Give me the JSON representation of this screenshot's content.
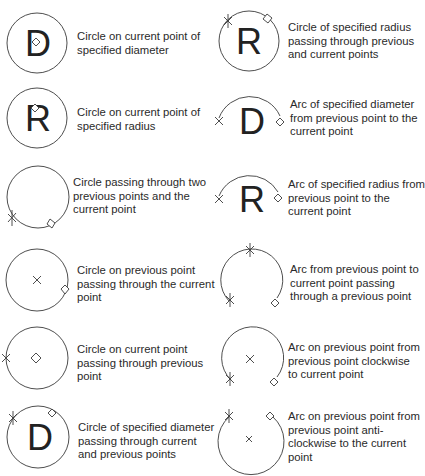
{
  "legend": {
    "left": [
      {
        "symbol": "circle-diameter-current",
        "letter": "D",
        "lines": [
          "Circle on current point of",
          "specified diameter"
        ]
      },
      {
        "symbol": "circle-radius-current",
        "letter": "R",
        "lines": [
          "Circle on current point of",
          "specified radius"
        ]
      },
      {
        "symbol": "circle-three-points",
        "letter": "",
        "lines": [
          "Circle passing through two",
          "previous points and the",
          "current point"
        ]
      },
      {
        "symbol": "circle-on-previous-through-current",
        "letter": "",
        "lines": [
          "Circle on previous point",
          "passing through the current",
          "point"
        ]
      },
      {
        "symbol": "circle-on-current-through-previous",
        "letter": "",
        "lines": [
          "Circle on current point",
          "passing through previous",
          "point"
        ]
      },
      {
        "symbol": "circle-diameter-through-points",
        "letter": "D",
        "lines": [
          "Circle of specified diameter",
          "passing through current",
          "and previous points"
        ]
      }
    ],
    "right": [
      {
        "symbol": "circle-radius-through-points",
        "letter": "R",
        "lines": [
          "Circle of specified radius",
          "passing through previous",
          "and current points"
        ]
      },
      {
        "symbol": "arc-diameter",
        "letter": "D",
        "lines": [
          "Arc of specified diameter",
          "from previous point to the",
          "current point"
        ]
      },
      {
        "symbol": "arc-radius",
        "letter": "R",
        "lines": [
          "Arc of specified radius from",
          "previous point to the",
          "current point"
        ]
      },
      {
        "symbol": "arc-three-points",
        "letter": "",
        "lines": [
          "Arc from previous point to",
          "current point passing",
          "through a previous point"
        ]
      },
      {
        "symbol": "arc-clockwise",
        "letter": "",
        "lines": [
          "Arc on previous point from",
          "previous point clockwise",
          "to current point"
        ]
      },
      {
        "symbol": "arc-anticlockwise",
        "letter": "",
        "lines": [
          "Arc on previous point from",
          "previous point anti-",
          "clockwise to the current",
          "point"
        ]
      }
    ]
  },
  "colors": {
    "stroke": "#3a3a3a",
    "text": "#2a2a2a",
    "background": "#ffffff"
  }
}
